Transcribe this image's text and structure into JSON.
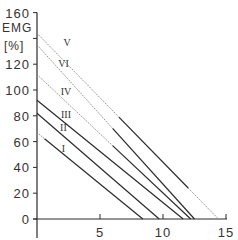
{
  "chart_data": {
    "type": "line",
    "title": "",
    "xlabel": "",
    "ylabel": "EMG [%]",
    "ylabel_lines": [
      "EMG",
      "[%]"
    ],
    "xlim": [
      0,
      15
    ],
    "ylim": [
      0,
      160
    ],
    "x_ticks": [
      0,
      5,
      10,
      15
    ],
    "x_tick_labels": [
      "",
      "5",
      "10",
      "15"
    ],
    "y_ticks": [
      0,
      20,
      40,
      60,
      80,
      100,
      120,
      140,
      160
    ],
    "y_tick_labels": [
      "0",
      "20",
      "40",
      "60",
      "80",
      "100",
      "120",
      "",
      "160"
    ],
    "grid": false,
    "legend": "inline roman numeral labels",
    "series": [
      {
        "name": "I",
        "x": [
          0,
          8.4
        ],
        "y": [
          67,
          0
        ],
        "label_pos": [
          2.1,
          52
        ],
        "dotted_until_x": 0.6
      },
      {
        "name": "II",
        "x": [
          0,
          9.7
        ],
        "y": [
          82,
          0
        ],
        "label_pos": [
          2.1,
          68
        ],
        "dotted_until_x": 0
      },
      {
        "name": "III",
        "x": [
          0,
          11.6
        ],
        "y": [
          92,
          0
        ],
        "label_pos": [
          2.3,
          78
        ],
        "dotted_until_x": 0
      },
      {
        "name": "IV",
        "x": [
          0,
          12.2
        ],
        "y": [
          112,
          0
        ],
        "label_pos": [
          2.3,
          96
        ],
        "dotted_until_x": 6.0
      },
      {
        "name": "VI",
        "x": [
          0,
          12.5
        ],
        "y": [
          135,
          0
        ],
        "label_pos": [
          2.1,
          118
        ],
        "dotted_until_x": 6.0
      },
      {
        "name": "V",
        "x": [
          0,
          14.4
        ],
        "y": [
          144,
          0
        ],
        "label_pos": [
          2.4,
          134
        ],
        "dotted_until_x": 6.5,
        "dotted_from_x": 12.0
      }
    ]
  }
}
